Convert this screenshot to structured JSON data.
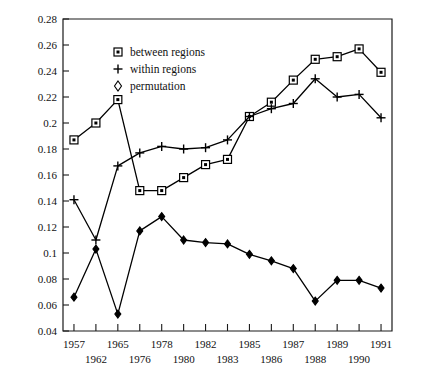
{
  "chart_data": {
    "type": "line",
    "title": "",
    "xlabel": "",
    "ylabel": "",
    "ylim": [
      0.04,
      0.28
    ],
    "ytick_step": 0.02,
    "grid": false,
    "legend_position": "top-left-inside",
    "categories": [
      "1957",
      "1962",
      "1965",
      "1976",
      "1978",
      "1980",
      "1982",
      "1983",
      "1985",
      "1986",
      "1987",
      "1988",
      "1989",
      "1990",
      "1991"
    ],
    "yticks": [
      "0.04",
      "0.06",
      "0.08",
      "0.1",
      "0.12",
      "0.14",
      "0.16",
      "0.18",
      "0.2",
      "0.22",
      "0.24",
      "0.26",
      "0.28"
    ],
    "xticks": [
      "1957",
      "1962",
      "1965",
      "1976",
      "1978",
      "1980",
      "1982",
      "1983",
      "1985",
      "1986",
      "1987",
      "1988",
      "1989",
      "1990",
      "1991"
    ],
    "series": [
      {
        "name": "between regions",
        "marker": "square",
        "values": [
          0.187,
          0.2,
          0.218,
          0.148,
          0.148,
          0.158,
          0.168,
          0.172,
          0.205,
          0.216,
          0.233,
          0.249,
          0.251,
          0.257,
          0.239
        ]
      },
      {
        "name": "within regions",
        "marker": "plus",
        "values": [
          0.141,
          0.11,
          0.167,
          0.177,
          0.182,
          0.18,
          0.181,
          0.187,
          0.205,
          0.211,
          0.215,
          0.234,
          0.22,
          0.222,
          0.204
        ]
      },
      {
        "name": "permutation",
        "marker": "diamond",
        "values": [
          0.066,
          0.103,
          0.053,
          0.117,
          0.128,
          0.11,
          0.108,
          0.107,
          0.099,
          0.094,
          0.088,
          0.063,
          0.079,
          0.079,
          0.073
        ]
      }
    ]
  },
  "legend": {
    "items": [
      {
        "label": "between regions",
        "marker": "square"
      },
      {
        "label": "within regions",
        "marker": "plus"
      },
      {
        "label": "permutation",
        "marker": "diamond"
      }
    ]
  }
}
